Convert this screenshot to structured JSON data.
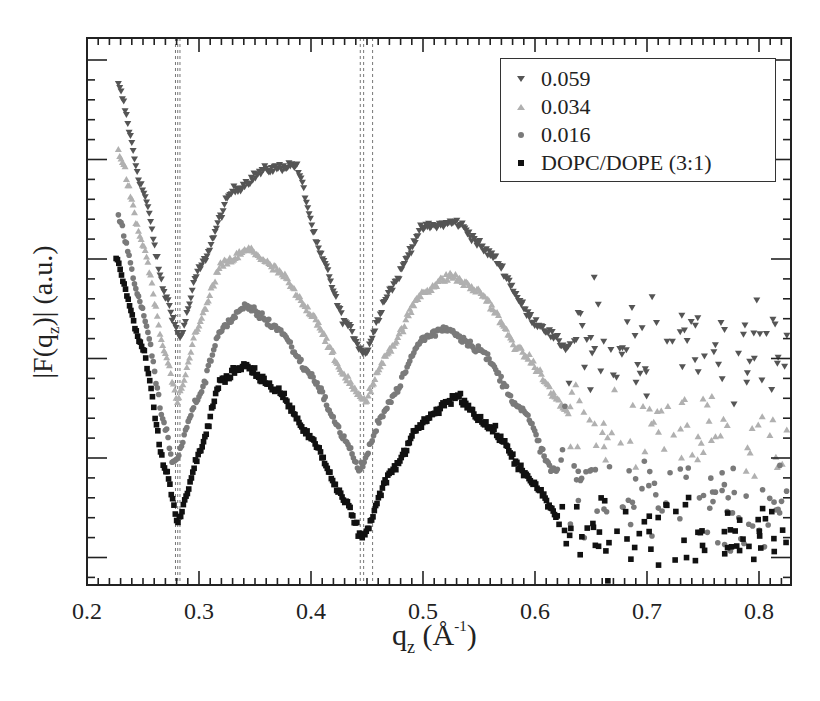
{
  "chart_data": {
    "type": "scatter",
    "title": "",
    "xlabel": "q_z (Å^-1)",
    "ylabel": "|F(q_z)| (a.u.)",
    "xlim": [
      0.2,
      0.83
    ],
    "ylim": "arbitrary units (no y tick labels)",
    "grid": false,
    "legend_position": "upper right",
    "x_tick_labels": [
      "0.2",
      "0.3",
      "0.4",
      "0.5",
      "0.6",
      "0.7",
      "0.8"
    ],
    "vertical_dashed_lines_qz": [
      0.279,
      0.281,
      0.283,
      0.444,
      0.447,
      0.455
    ],
    "series": [
      {
        "name": "0.059",
        "marker": "triangle-down",
        "color": "#555555",
        "noise_from_q": 0.63,
        "noise_band": [
          0.27,
          0.05
        ],
        "keypoints": [
          [
            0.228,
            0.95
          ],
          [
            0.25,
            0.75
          ],
          [
            0.27,
            0.55
          ],
          [
            0.283,
            0.47
          ],
          [
            0.3,
            0.6
          ],
          [
            0.33,
            0.75
          ],
          [
            0.36,
            0.79
          ],
          [
            0.386,
            0.8
          ],
          [
            0.41,
            0.62
          ],
          [
            0.43,
            0.5
          ],
          [
            0.448,
            0.44
          ],
          [
            0.47,
            0.56
          ],
          [
            0.5,
            0.68
          ],
          [
            0.53,
            0.69
          ],
          [
            0.56,
            0.63
          ],
          [
            0.6,
            0.5
          ],
          [
            0.63,
            0.45
          ],
          [
            0.7,
            0.46
          ],
          [
            0.83,
            0.45
          ]
        ]
      },
      {
        "name": "0.034",
        "marker": "triangle-up",
        "color": "#b0b0b0",
        "noise_from_q": 0.63,
        "noise_band": [
          0.2,
          0.045
        ],
        "keypoints": [
          [
            0.228,
            0.83
          ],
          [
            0.25,
            0.65
          ],
          [
            0.27,
            0.44
          ],
          [
            0.281,
            0.35
          ],
          [
            0.3,
            0.5
          ],
          [
            0.32,
            0.61
          ],
          [
            0.345,
            0.64
          ],
          [
            0.37,
            0.6
          ],
          [
            0.4,
            0.52
          ],
          [
            0.43,
            0.4
          ],
          [
            0.447,
            0.35
          ],
          [
            0.47,
            0.45
          ],
          [
            0.5,
            0.56
          ],
          [
            0.525,
            0.59
          ],
          [
            0.55,
            0.56
          ],
          [
            0.59,
            0.44
          ],
          [
            0.63,
            0.33
          ],
          [
            0.7,
            0.3
          ],
          [
            0.83,
            0.28
          ]
        ]
      },
      {
        "name": "0.016",
        "marker": "circle",
        "color": "#7a7a7a",
        "noise_from_q": 0.62,
        "noise_band": [
          0.13,
          0.045
        ],
        "keypoints": [
          [
            0.228,
            0.7
          ],
          [
            0.25,
            0.52
          ],
          [
            0.27,
            0.3
          ],
          [
            0.277,
            0.23
          ],
          [
            0.3,
            0.36
          ],
          [
            0.32,
            0.49
          ],
          [
            0.343,
            0.53
          ],
          [
            0.37,
            0.49
          ],
          [
            0.4,
            0.4
          ],
          [
            0.43,
            0.28
          ],
          [
            0.443,
            0.22
          ],
          [
            0.47,
            0.35
          ],
          [
            0.5,
            0.47
          ],
          [
            0.52,
            0.49
          ],
          [
            0.55,
            0.45
          ],
          [
            0.59,
            0.33
          ],
          [
            0.615,
            0.22
          ],
          [
            0.65,
            0.18
          ],
          [
            0.7,
            0.18
          ],
          [
            0.83,
            0.17
          ]
        ]
      },
      {
        "name": "DOPC/DOPE (3:1)",
        "marker": "square",
        "color": "#111111",
        "noise_from_q": 0.62,
        "noise_band": [
          0.05,
          0.035
        ],
        "keypoints": [
          [
            0.226,
            0.62
          ],
          [
            0.25,
            0.45
          ],
          [
            0.27,
            0.22
          ],
          [
            0.281,
            0.12
          ],
          [
            0.3,
            0.25
          ],
          [
            0.32,
            0.39
          ],
          [
            0.34,
            0.42
          ],
          [
            0.37,
            0.37
          ],
          [
            0.4,
            0.28
          ],
          [
            0.43,
            0.16
          ],
          [
            0.446,
            0.09
          ],
          [
            0.47,
            0.21
          ],
          [
            0.5,
            0.31
          ],
          [
            0.53,
            0.36
          ],
          [
            0.56,
            0.3
          ],
          [
            0.6,
            0.19
          ],
          [
            0.62,
            0.13
          ],
          [
            0.65,
            0.1
          ],
          [
            0.7,
            0.11
          ],
          [
            0.83,
            0.09
          ]
        ]
      }
    ]
  },
  "legend": {
    "items": [
      {
        "label": "0.059",
        "marker": "triangle-down"
      },
      {
        "label": "0.034",
        "marker": "triangle-up"
      },
      {
        "label": "0.016",
        "marker": "circle"
      },
      {
        "label": "DOPC/DOPE (3:1)",
        "marker": "square"
      }
    ]
  },
  "axes": {
    "x_main": "q",
    "x_sub": "z",
    "x_unit_open": " (Å",
    "x_unit_sup": "-1",
    "x_unit_close": ")",
    "y_main": "|F(q",
    "y_sub": "z",
    "y_rest": ")| (a.u.)"
  }
}
